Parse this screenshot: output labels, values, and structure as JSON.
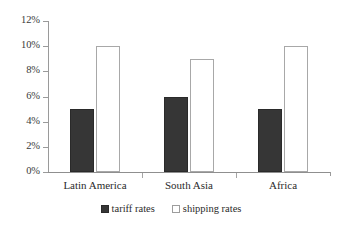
{
  "chart_data": {
    "type": "bar",
    "title": "",
    "subtitle": "",
    "xlabel": "",
    "ylabel": "",
    "categories": [
      "Latin America",
      "South Asia",
      "Africa"
    ],
    "series": [
      {
        "name": "tariff rates",
        "values": [
          5,
          6,
          5
        ],
        "color": "#363636",
        "fill": "solid"
      },
      {
        "name": "shipping rates",
        "values": [
          10,
          9,
          10
        ],
        "color": "#ffffff",
        "fill": "outline"
      }
    ],
    "ylim": [
      0,
      12
    ],
    "ytick_step": 2,
    "ytick_labels": [
      "0%",
      "2%",
      "4%",
      "6%",
      "8%",
      "10%",
      "12%"
    ],
    "ytick_values": [
      0,
      2,
      4,
      6,
      8,
      10,
      12
    ],
    "grid": false,
    "legend_position": "bottom",
    "value_suffix": "%"
  },
  "legend": {
    "items": [
      {
        "label": "tariff rates",
        "swatch": "filled-square-icon"
      },
      {
        "label": "shipping rates",
        "swatch": "outlined-square-icon"
      }
    ]
  },
  "colors": {
    "series_tariff": "#363636",
    "series_shipping": "#ffffff",
    "axis": "#9a9a9a",
    "text": "#2b2b2b",
    "background": "#ffffff"
  }
}
